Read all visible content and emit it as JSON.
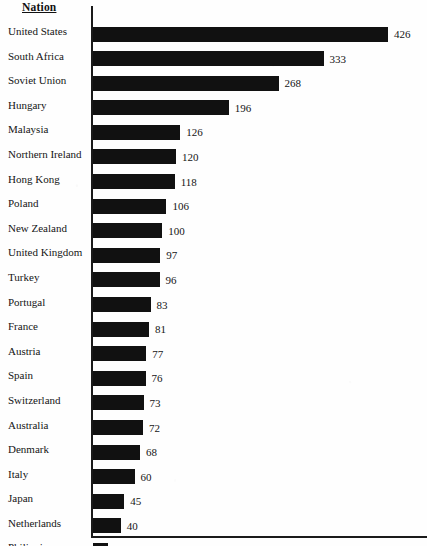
{
  "chart_data": {
    "type": "bar",
    "orientation": "horizontal",
    "title": "",
    "xlabel": "",
    "ylabel": "Nation",
    "column_header": "Nation",
    "grid": false,
    "legend": null,
    "axis_ticks": [],
    "xlim": [
      0,
      426
    ],
    "value_labels_shown": true,
    "sorted": "descending",
    "categories": [
      "United States",
      "South Africa",
      "Soviet Union",
      "Hungary",
      "Malaysia",
      "Northern Ireland",
      "Hong Kong",
      "Poland",
      "New Zealand",
      "United Kingdom",
      "Turkey",
      "Portugal",
      "France",
      "Austria",
      "Spain",
      "Switzerland",
      "Australia",
      "Denmark",
      "Italy",
      "Japan",
      "Netherlands",
      "Philippines"
    ],
    "values": [
      426,
      333,
      268,
      196,
      126,
      120,
      118,
      106,
      100,
      97,
      96,
      83,
      81,
      77,
      76,
      73,
      72,
      68,
      60,
      45,
      40,
      22
    ],
    "bar_color": "#111111",
    "axis_color": "#1a1a1a",
    "background_color": "#fefefe"
  },
  "header": {
    "nation_label": "Nation"
  },
  "rows": [
    {
      "label": "United States",
      "value": "426"
    },
    {
      "label": "South Africa",
      "value": "333"
    },
    {
      "label": "Soviet Union",
      "value": "268"
    },
    {
      "label": "Hungary",
      "value": "196"
    },
    {
      "label": "Malaysia",
      "value": "126"
    },
    {
      "label": "Northern Ireland",
      "value": "120"
    },
    {
      "label": "Hong Kong",
      "value": "118"
    },
    {
      "label": "Poland",
      "value": "106"
    },
    {
      "label": "New Zealand",
      "value": "100"
    },
    {
      "label": "United Kingdom",
      "value": "97"
    },
    {
      "label": "Turkey",
      "value": "96"
    },
    {
      "label": "Portugal",
      "value": "83"
    },
    {
      "label": "France",
      "value": "81"
    },
    {
      "label": "Austria",
      "value": "77"
    },
    {
      "label": "Spain",
      "value": "76"
    },
    {
      "label": "Switzerland",
      "value": "73"
    },
    {
      "label": "Australia",
      "value": "72"
    },
    {
      "label": "Denmark",
      "value": "68"
    },
    {
      "label": "Italy",
      "value": "60"
    },
    {
      "label": "Japan",
      "value": "45"
    },
    {
      "label": "Netherlands",
      "value": "40"
    },
    {
      "label": "Philippines",
      "value": "22"
    }
  ]
}
